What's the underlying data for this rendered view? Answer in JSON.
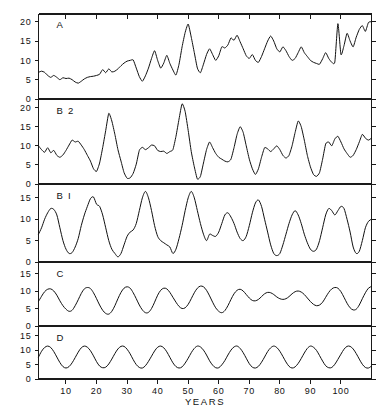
{
  "figure": {
    "name": "multi-panel-time-series",
    "background_color": "#ffffff",
    "line_color": "#111111",
    "axis_color": "#1a1a1a"
  },
  "axes": {
    "x_title": "YEARS",
    "x_ticks": [
      10,
      20,
      30,
      40,
      50,
      60,
      70,
      80,
      90,
      100
    ],
    "x_tick_labels": [
      "10",
      "20",
      "30",
      "40",
      "50",
      "60",
      "70",
      "80",
      "90",
      "100"
    ],
    "x_min": 1,
    "x_max": 110,
    "y_ticks_major": [
      0,
      5,
      10,
      15,
      20
    ],
    "y_tick_labels_major": [
      "0",
      "5",
      "10",
      "15",
      "20"
    ],
    "y_ticks_minor": [
      0,
      5,
      10,
      15
    ],
    "y_tick_labels_minor": [
      "0",
      "5",
      "10",
      "15"
    ],
    "grid": "off",
    "legend": "none"
  },
  "chart_data": {
    "type": "line",
    "title": "",
    "subtitle": "",
    "xlabel": "YEARS",
    "ylabel": "",
    "xlim": [
      1,
      110
    ],
    "grid": false,
    "legend_position": "none",
    "panel_count": 4,
    "panels": [
      {
        "label": "A",
        "ylim": [
          0,
          22
        ],
        "yticks": [
          0,
          5,
          10,
          15,
          20
        ],
        "description": "observed irregular annual series with rising trend",
        "x": [
          1,
          2,
          3,
          4,
          5,
          6,
          7,
          8,
          9,
          10,
          11,
          12,
          13,
          14,
          15,
          16,
          17,
          18,
          19,
          20,
          21,
          22,
          23,
          24,
          25,
          26,
          27,
          28,
          29,
          30,
          31,
          32,
          33,
          34,
          35,
          36,
          37,
          38,
          39,
          40,
          41,
          42,
          43,
          44,
          45,
          46,
          47,
          48,
          49,
          50,
          51,
          52,
          53,
          54,
          55,
          56,
          57,
          58,
          59,
          60,
          61,
          62,
          63,
          64,
          65,
          66,
          67,
          68,
          69,
          70,
          71,
          72,
          73,
          74,
          75,
          76,
          77,
          78,
          79,
          80,
          81,
          82,
          83,
          84,
          85,
          86,
          87,
          88,
          89,
          90,
          91,
          92,
          93,
          94,
          95,
          96,
          97,
          98,
          99,
          100,
          101,
          102,
          103,
          104,
          105,
          106,
          107,
          108,
          109,
          110
        ],
        "values": [
          6.9,
          7.2,
          6.9,
          6.1,
          5.6,
          6.1,
          5.6,
          5.0,
          5.5,
          5.3,
          5.4,
          5.0,
          4.4,
          4.1,
          4.6,
          5.2,
          5.6,
          5.8,
          5.9,
          6.1,
          6.4,
          7.6,
          6.8,
          7.8,
          7.0,
          7.2,
          7.8,
          8.6,
          9.3,
          9.8,
          10.0,
          10.1,
          8.0,
          5.8,
          4.6,
          6.0,
          8.0,
          10.5,
          12.5,
          10.0,
          8.0,
          9.3,
          11.3,
          9.2,
          7.5,
          6.2,
          9.0,
          13.5,
          17.2,
          19.4,
          16.0,
          12.0,
          8.0,
          6.8,
          9.0,
          11.5,
          13.0,
          11.5,
          10.0,
          11.2,
          13.5,
          13.2,
          14.0,
          15.8,
          15.2,
          16.5,
          14.8,
          13.0,
          11.2,
          10.5,
          11.5,
          10.0,
          9.5,
          11.0,
          13.0,
          15.0,
          16.3,
          15.0,
          13.0,
          12.2,
          13.5,
          12.5,
          11.0,
          10.0,
          10.5,
          12.0,
          13.5,
          12.0,
          11.0,
          10.0,
          9.5,
          9.2,
          9.0,
          10.4,
          12.0,
          10.5,
          9.5,
          9.6,
          19.5,
          11.5,
          13.8,
          17.0,
          15.0,
          13.5,
          16.0,
          18.0,
          19.0,
          17.5,
          19.8,
          20.0
        ]
      },
      {
        "label": "B 2",
        "ylim": [
          0,
          22
        ],
        "yticks": [
          0,
          5,
          10,
          15,
          20
        ],
        "description": "model B2 simulated series, large intermittent peaks",
        "x": [
          1,
          2,
          3,
          4,
          5,
          6,
          7,
          8,
          9,
          10,
          11,
          12,
          13,
          14,
          15,
          16,
          17,
          18,
          19,
          20,
          21,
          22,
          23,
          24,
          25,
          26,
          27,
          28,
          29,
          30,
          31,
          32,
          33,
          34,
          35,
          36,
          37,
          38,
          39,
          40,
          41,
          42,
          43,
          44,
          45,
          46,
          47,
          48,
          49,
          50,
          51,
          52,
          53,
          54,
          55,
          56,
          57,
          58,
          59,
          60,
          61,
          62,
          63,
          64,
          65,
          66,
          67,
          68,
          69,
          70,
          71,
          72,
          73,
          74,
          75,
          76,
          77,
          78,
          79,
          80,
          81,
          82,
          83,
          84,
          85,
          86,
          87,
          88,
          89,
          90,
          91,
          92,
          93,
          94,
          95,
          96,
          97,
          98,
          99,
          100,
          101,
          102,
          103,
          104,
          105,
          106,
          107,
          108,
          109,
          110
        ],
        "values": [
          10.0,
          9.0,
          8.3,
          9.5,
          8.2,
          8.8,
          7.5,
          7.0,
          7.6,
          8.8,
          10.2,
          11.5,
          11.0,
          11.2,
          10.2,
          9.0,
          7.5,
          6.0,
          4.0,
          3.3,
          5.5,
          9.5,
          14.0,
          18.5,
          16.5,
          13.0,
          9.0,
          6.0,
          3.0,
          1.5,
          1.6,
          2.8,
          5.2,
          8.8,
          9.6,
          9.0,
          9.5,
          10.2,
          10.0,
          8.8,
          8.5,
          8.6,
          8.0,
          8.5,
          9.0,
          12.5,
          17.0,
          21.0,
          19.0,
          14.0,
          8.5,
          4.5,
          1.3,
          2.0,
          5.5,
          9.0,
          11.0,
          9.5,
          8.0,
          7.0,
          6.5,
          6.0,
          5.8,
          6.5,
          9.5,
          13.0,
          15.0,
          13.5,
          10.0,
          6.5,
          4.0,
          2.5,
          4.0,
          7.0,
          9.5,
          9.2,
          8.5,
          9.2,
          10.0,
          9.0,
          7.5,
          6.8,
          7.5,
          10.0,
          13.5,
          16.5,
          15.0,
          11.5,
          7.5,
          4.5,
          2.5,
          2.0,
          3.0,
          6.5,
          10.5,
          11.0,
          10.0,
          11.8,
          12.5,
          11.0,
          9.2,
          8.0,
          7.0,
          7.5,
          9.0,
          11.0,
          13.0,
          12.0,
          11.5,
          12.0
        ]
      },
      {
        "label": "B I",
        "ylim": [
          0,
          18
        ],
        "yticks": [
          0,
          5,
          10,
          15
        ],
        "description": "model B1 simulated series, smoother broad cycles",
        "x": [
          1,
          2,
          3,
          4,
          5,
          6,
          7,
          8,
          9,
          10,
          11,
          12,
          13,
          14,
          15,
          16,
          17,
          18,
          19,
          20,
          21,
          22,
          23,
          24,
          25,
          26,
          27,
          28,
          29,
          30,
          31,
          32,
          33,
          34,
          35,
          36,
          37,
          38,
          39,
          40,
          41,
          42,
          43,
          44,
          45,
          46,
          47,
          48,
          49,
          50,
          51,
          52,
          53,
          54,
          55,
          56,
          57,
          58,
          59,
          60,
          61,
          62,
          63,
          64,
          65,
          66,
          67,
          68,
          69,
          70,
          71,
          72,
          73,
          74,
          75,
          76,
          77,
          78,
          79,
          80,
          81,
          82,
          83,
          84,
          85,
          86,
          87,
          88,
          89,
          90,
          91,
          92,
          93,
          94,
          95,
          96,
          97,
          98,
          99,
          100,
          101,
          102,
          103,
          104,
          105,
          106,
          107,
          108,
          109,
          110
        ],
        "values": [
          6.5,
          8.0,
          10.0,
          11.5,
          12.5,
          12.3,
          11.0,
          8.0,
          5.0,
          3.0,
          2.0,
          2.2,
          3.5,
          5.5,
          8.5,
          11.0,
          13.0,
          14.8,
          15.2,
          13.5,
          13.0,
          11.0,
          8.0,
          5.0,
          3.0,
          2.0,
          1.2,
          2.0,
          4.0,
          6.0,
          7.0,
          7.5,
          9.0,
          12.0,
          15.0,
          16.5,
          15.0,
          12.0,
          8.5,
          6.0,
          5.0,
          4.5,
          4.0,
          3.5,
          2.0,
          3.0,
          5.5,
          8.5,
          12.0,
          15.0,
          16.5,
          15.0,
          12.0,
          9.0,
          6.5,
          5.0,
          6.5,
          6.2,
          6.0,
          7.0,
          9.0,
          11.0,
          11.5,
          10.5,
          9.0,
          7.0,
          5.5,
          5.0,
          6.0,
          8.5,
          11.5,
          13.8,
          14.5,
          13.0,
          10.0,
          7.0,
          4.0,
          2.0,
          1.5,
          2.0,
          4.0,
          6.5,
          9.0,
          11.0,
          12.0,
          11.0,
          9.0,
          6.5,
          4.5,
          3.0,
          2.5,
          3.0,
          5.0,
          8.0,
          11.0,
          12.5,
          12.0,
          11.0,
          12.0,
          13.0,
          12.5,
          10.0,
          7.0,
          3.5,
          2.0,
          2.5,
          5.0,
          8.0,
          9.5,
          10.0
        ]
      },
      {
        "label": "C",
        "ylim": [
          0,
          18
        ],
        "yticks": [
          0,
          5,
          10,
          15
        ],
        "description": "quasi-periodic smooth cycle, modulated amplitude",
        "x": [
          1,
          2,
          3,
          4,
          5,
          6,
          7,
          8,
          9,
          10,
          11,
          12,
          13,
          14,
          15,
          16,
          17,
          18,
          19,
          20,
          21,
          22,
          23,
          24,
          25,
          26,
          27,
          28,
          29,
          30,
          31,
          32,
          33,
          34,
          35,
          36,
          37,
          38,
          39,
          40,
          41,
          42,
          43,
          44,
          45,
          46,
          47,
          48,
          49,
          50,
          51,
          52,
          53,
          54,
          55,
          56,
          57,
          58,
          59,
          60,
          61,
          62,
          63,
          64,
          65,
          66,
          67,
          68,
          69,
          70,
          71,
          72,
          73,
          74,
          75,
          76,
          77,
          78,
          79,
          80,
          81,
          82,
          83,
          84,
          85,
          86,
          87,
          88,
          89,
          90,
          91,
          92,
          93,
          94,
          95,
          96,
          97,
          98,
          99,
          100,
          101,
          102,
          103,
          104,
          105,
          106,
          107,
          108,
          109,
          110
        ],
        "values": [
          7.0,
          8.5,
          9.8,
          10.5,
          10.6,
          10.0,
          8.8,
          7.2,
          5.8,
          4.8,
          4.2,
          4.5,
          5.8,
          7.5,
          9.3,
          10.6,
          11.0,
          10.7,
          9.5,
          7.8,
          6.0,
          4.5,
          3.6,
          3.4,
          4.2,
          5.8,
          7.8,
          9.6,
          10.8,
          11.2,
          10.8,
          9.5,
          7.8,
          6.0,
          4.6,
          3.8,
          3.9,
          5.0,
          6.8,
          8.8,
          10.2,
          10.8,
          10.6,
          9.6,
          8.2,
          6.8,
          5.6,
          5.0,
          5.2,
          6.2,
          7.8,
          9.5,
          10.8,
          11.4,
          11.2,
          10.2,
          8.6,
          6.8,
          5.2,
          4.2,
          3.8,
          4.4,
          5.8,
          7.6,
          9.2,
          10.2,
          10.5,
          10.0,
          9.0,
          8.0,
          7.3,
          7.2,
          7.6,
          8.4,
          9.2,
          9.6,
          9.5,
          9.0,
          8.3,
          7.8,
          7.6,
          7.8,
          8.4,
          9.2,
          9.8,
          10.0,
          9.7,
          9.0,
          8.0,
          7.0,
          6.2,
          5.8,
          6.0,
          6.8,
          8.2,
          9.6,
          10.6,
          11.0,
          10.8,
          9.8,
          8.2,
          6.5,
          5.2,
          4.6,
          4.8,
          6.0,
          7.8,
          9.5,
          10.8,
          11.3
        ]
      },
      {
        "label": "D",
        "ylim": [
          0,
          18
        ],
        "yticks": [
          0,
          5,
          10,
          15
        ],
        "description": "pure sinusoid, period about 11.1 years, mean 7.6, amplitude 3.8",
        "period_years": 11.1,
        "mean": 7.6,
        "amplitude": 3.8,
        "x": [
          1,
          2,
          3,
          4,
          5,
          6,
          7,
          8,
          9,
          10,
          11,
          12,
          13,
          14,
          15,
          16,
          17,
          18,
          19,
          20,
          21,
          22,
          23,
          24,
          25,
          26,
          27,
          28,
          29,
          30,
          31,
          32,
          33,
          34,
          35,
          36,
          37,
          38,
          39,
          40,
          41,
          42,
          43,
          44,
          45,
          46,
          47,
          48,
          49,
          50,
          51,
          52,
          53,
          54,
          55,
          56,
          57,
          58,
          59,
          60,
          61,
          62,
          63,
          64,
          65,
          66,
          67,
          68,
          69,
          70,
          71,
          72,
          73,
          74,
          75,
          76,
          77,
          78,
          79,
          80,
          81,
          82,
          83,
          84,
          85,
          86,
          87,
          88,
          89,
          90,
          91,
          92,
          93,
          94,
          95,
          96,
          97,
          98,
          99,
          100,
          101,
          102,
          103,
          104,
          105,
          106,
          107,
          108,
          109,
          110
        ],
        "values": [
          7.6,
          9.6,
          10.9,
          11.4,
          10.9,
          9.5,
          7.6,
          5.7,
          4.3,
          3.8,
          4.3,
          5.6,
          7.4,
          9.3,
          10.8,
          11.4,
          11.0,
          9.8,
          8.0,
          6.0,
          4.5,
          3.9,
          4.1,
          5.2,
          6.9,
          8.8,
          10.4,
          11.3,
          11.3,
          10.3,
          8.7,
          6.7,
          5.0,
          4.0,
          3.8,
          4.6,
          6.1,
          7.9,
          9.7,
          11.0,
          11.4,
          10.8,
          9.4,
          7.5,
          5.6,
          4.3,
          3.8,
          4.2,
          5.5,
          7.2,
          9.1,
          10.6,
          11.4,
          11.1,
          10.0,
          8.3,
          6.3,
          4.8,
          3.9,
          3.9,
          4.9,
          6.4,
          8.3,
          10.0,
          11.1,
          11.4,
          10.6,
          9.1,
          7.2,
          5.3,
          4.1,
          3.8,
          4.4,
          5.8,
          7.6,
          9.5,
          10.8,
          11.4,
          10.9,
          9.6,
          7.8,
          5.9,
          4.4,
          3.8,
          4.2,
          5.4,
          7.1,
          9.0,
          10.6,
          11.4,
          11.0,
          9.9,
          8.1,
          6.2,
          4.6,
          3.9,
          4.0,
          5.1,
          6.8,
          8.6,
          10.3,
          11.3,
          11.3,
          10.4,
          8.8,
          6.9,
          5.1,
          4.0,
          3.8,
          4.5
        ]
      }
    ]
  }
}
